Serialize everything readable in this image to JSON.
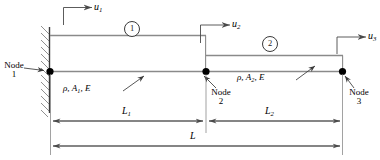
{
  "figure": {
    "background_color": "#ffffff",
    "line_color": "#555555",
    "text_color": "#000000"
  },
  "support": {
    "type": "fixed-support-hatching",
    "label": "fixed-wall"
  },
  "nodes": [
    {
      "id": "1",
      "name_text": "Node",
      "number_text": "1"
    },
    {
      "id": "2",
      "name_text": "Node",
      "number_text": "2"
    },
    {
      "id": "3",
      "name_text": "Node",
      "number_text": "3"
    }
  ],
  "elements": [
    {
      "id": "1",
      "number_text": "1",
      "material_text": "ρ, A",
      "material_sub": "1",
      "material_tail": ", E"
    },
    {
      "id": "2",
      "number_text": "2",
      "material_text": "ρ, A",
      "material_sub": "2",
      "material_tail": ", E"
    }
  ],
  "displacements": [
    {
      "id": "u1",
      "symbol": "u",
      "subscript": "1"
    },
    {
      "id": "u2",
      "symbol": "u",
      "subscript": "2"
    },
    {
      "id": "u3",
      "symbol": "u",
      "subscript": "3"
    }
  ],
  "dimensions": [
    {
      "id": "L1",
      "symbol": "L",
      "subscript": "1"
    },
    {
      "id": "L2",
      "symbol": "L",
      "subscript": "2"
    },
    {
      "id": "L",
      "symbol": "L",
      "subscript": ""
    }
  ]
}
